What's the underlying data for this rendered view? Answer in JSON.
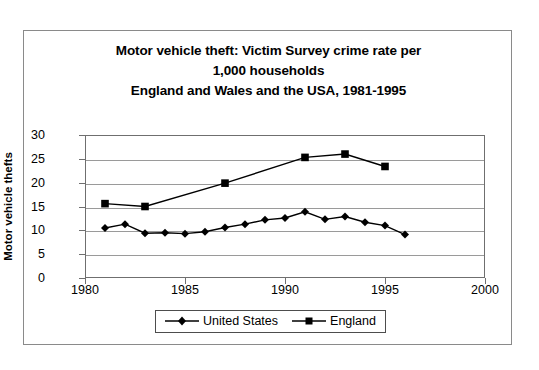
{
  "chart_data": {
    "type": "line",
    "title": "Motor vehicle theft: Victim Survey crime rate per 1,000 households England and Wales and the USA, 1981-1995",
    "title_lines": [
      "Motor vehicle theft: Victim Survey crime rate per",
      "1,000 households",
      "England and Wales and the USA, 1981-1995"
    ],
    "xlabel": "",
    "ylabel": "Motor vehicle thefts",
    "xlim": [
      1980,
      2000
    ],
    "ylim": [
      0,
      30
    ],
    "xticks": [
      1980,
      1985,
      1990,
      1995,
      2000
    ],
    "xtick_labels": [
      "1980",
      "1985",
      "1990",
      "1995",
      "2000"
    ],
    "yticks": [
      0,
      5,
      10,
      15,
      20,
      25,
      30
    ],
    "ytick_labels": [
      "0",
      "5",
      "10",
      "15",
      "20",
      "25",
      "30"
    ],
    "grid": "horizontal",
    "legend_position": "bottom-center",
    "series": [
      {
        "name": "United States",
        "marker": "diamond",
        "color": "#000000",
        "x": [
          1981,
          1982,
          1983,
          1984,
          1985,
          1986,
          1987,
          1988,
          1989,
          1990,
          1991,
          1992,
          1993,
          1994,
          1995,
          1996
        ],
        "values": [
          10.5,
          11.3,
          9.4,
          9.5,
          9.3,
          9.7,
          10.6,
          11.3,
          12.2,
          12.6,
          13.9,
          12.3,
          12.9,
          11.7,
          11.0,
          9.1
        ]
      },
      {
        "name": "England",
        "marker": "square",
        "color": "#000000",
        "x": [
          1981,
          1983,
          1987,
          1991,
          1993,
          1995
        ],
        "values": [
          15.6,
          15.0,
          19.9,
          25.3,
          26.0,
          23.4
        ]
      }
    ]
  },
  "legend": {
    "items": [
      {
        "label": "United States",
        "marker": "diamond"
      },
      {
        "label": "England",
        "marker": "square"
      }
    ]
  }
}
